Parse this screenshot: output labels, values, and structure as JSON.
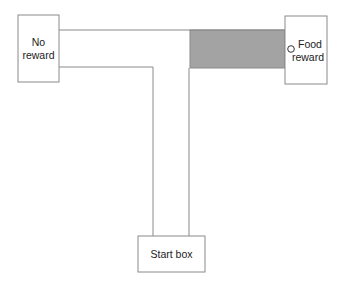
{
  "diagram": {
    "boxes": {
      "no_reward": {
        "label_line1": "No",
        "label_line2": "reward"
      },
      "food_reward": {
        "label_line1": "Food",
        "label_line2": "reward"
      },
      "start": {
        "label": "Start box"
      }
    },
    "colors": {
      "line": "#8a8a8a",
      "goal_arm_fill": "#a3a3a3",
      "background": "#ffffff"
    }
  }
}
